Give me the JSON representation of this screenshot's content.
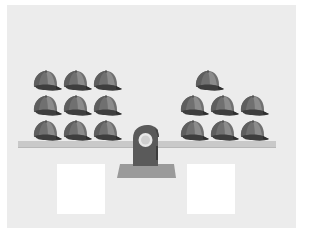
{
  "scene": {
    "description": "Balance scale (seesaw) with baseball caps on each side and two blank answer boxes below",
    "colors": {
      "background": "#ececec",
      "cap_light": "#8a8a8a",
      "cap_mid": "#6e6e6e",
      "cap_dark": "#4a4a4a",
      "plank": "#c9c9c9",
      "fulcrum": "#5a5a5a",
      "fulcrum_base": "#9a9a9a",
      "answer_box": "#ffffff"
    }
  },
  "left_pan": {
    "item": "baseball-cap",
    "count": 9,
    "caps": [
      {
        "x": 31,
        "y": 68
      },
      {
        "x": 61,
        "y": 68
      },
      {
        "x": 91,
        "y": 68
      },
      {
        "x": 31,
        "y": 93
      },
      {
        "x": 61,
        "y": 93
      },
      {
        "x": 91,
        "y": 93
      },
      {
        "x": 31,
        "y": 118
      },
      {
        "x": 61,
        "y": 118
      },
      {
        "x": 91,
        "y": 118
      }
    ]
  },
  "right_pan": {
    "item": "baseball-cap",
    "count": 7,
    "caps": [
      {
        "x": 193,
        "y": 68
      },
      {
        "x": 178,
        "y": 93
      },
      {
        "x": 208,
        "y": 93
      },
      {
        "x": 238,
        "y": 93
      },
      {
        "x": 178,
        "y": 118
      },
      {
        "x": 208,
        "y": 118
      },
      {
        "x": 238,
        "y": 118
      }
    ]
  },
  "answer_boxes": [
    {
      "side": "left",
      "value": "",
      "x": 57
    },
    {
      "side": "right",
      "value": "",
      "x": 187
    }
  ]
}
